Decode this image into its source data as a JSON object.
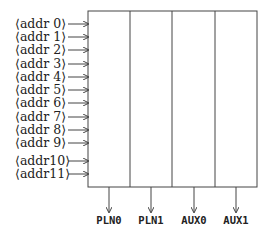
{
  "diagram": {
    "box": {
      "left": 88,
      "top": 11,
      "right": 257,
      "bottom": 187
    },
    "inputs": [
      {
        "label": "⟨addr  0⟩",
        "y": 24
      },
      {
        "label": "⟨addr  1⟩",
        "y": 37
      },
      {
        "label": "⟨addr  2⟩",
        "y": 50
      },
      {
        "label": "⟨addr  3⟩",
        "y": 64
      },
      {
        "label": "⟨addr  4⟩",
        "y": 77
      },
      {
        "label": "⟨addr  5⟩",
        "y": 90
      },
      {
        "label": "⟨addr  6⟩",
        "y": 103
      },
      {
        "label": "⟨addr  7⟩",
        "y": 117
      },
      {
        "label": "⟨addr  8⟩",
        "y": 130
      },
      {
        "label": "⟨addr  9⟩",
        "y": 143
      },
      {
        "label": "⟨addr10⟩",
        "y": 161
      },
      {
        "label": "⟨addr11⟩",
        "y": 174
      }
    ],
    "columns": [
      {
        "label": "PLN0",
        "x": 109
      },
      {
        "label": "PLN1",
        "x": 151
      },
      {
        "label": "AUX0",
        "x": 194
      },
      {
        "label": "AUX1",
        "x": 236
      }
    ],
    "dividers_x": [
      130,
      172,
      215
    ]
  }
}
